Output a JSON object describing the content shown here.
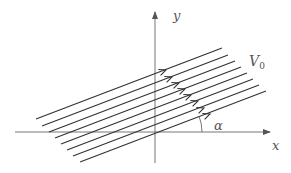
{
  "diagram": {
    "labels": {
      "y_axis": "y",
      "x_axis": "x",
      "velocity": "V",
      "velocity_subscript": "0",
      "angle": "α"
    },
    "streamlines": [
      {
        "x1": 36,
        "y1": 119,
        "x2": 222,
        "y2": 48,
        "ax": 166,
        "ay": 70
      },
      {
        "x1": 42,
        "y1": 126,
        "x2": 228,
        "y2": 55,
        "ax": 172,
        "ay": 77
      },
      {
        "x1": 49,
        "y1": 132,
        "x2": 235,
        "y2": 61,
        "ax": 179,
        "ay": 83
      },
      {
        "x1": 55,
        "y1": 138,
        "x2": 241,
        "y2": 67,
        "ax": 185,
        "ay": 89
      },
      {
        "x1": 61,
        "y1": 144,
        "x2": 247,
        "y2": 73,
        "ax": 191,
        "ay": 95
      },
      {
        "x1": 67,
        "y1": 150,
        "x2": 253,
        "y2": 79,
        "ax": 198,
        "ay": 101
      },
      {
        "x1": 73,
        "y1": 156,
        "x2": 259,
        "y2": 85,
        "ax": 204,
        "ay": 108
      },
      {
        "x1": 80,
        "y1": 162,
        "x2": 266,
        "y2": 91,
        "ax": 210,
        "ay": 114
      }
    ],
    "colors": {
      "line": "#333333",
      "axis": "#555555",
      "text": "#555555"
    }
  }
}
